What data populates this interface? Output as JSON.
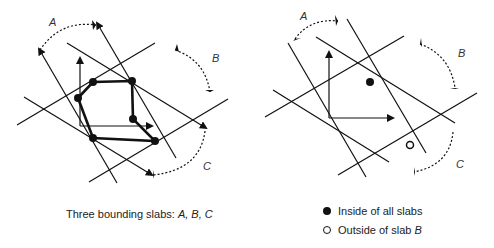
{
  "left_panel": {
    "labels": {
      "A": "A",
      "B": "B",
      "C": "C"
    },
    "caption_prefix": "Three bounding slabs: ",
    "caption_slabs": "A, B, C"
  },
  "right_panel": {
    "labels": {
      "A": "A",
      "B": "B",
      "C": "C"
    }
  },
  "legend": {
    "inside": "Inside of all slabs",
    "outside_prefix": "Outside of slab ",
    "outside_slab": "B"
  }
}
